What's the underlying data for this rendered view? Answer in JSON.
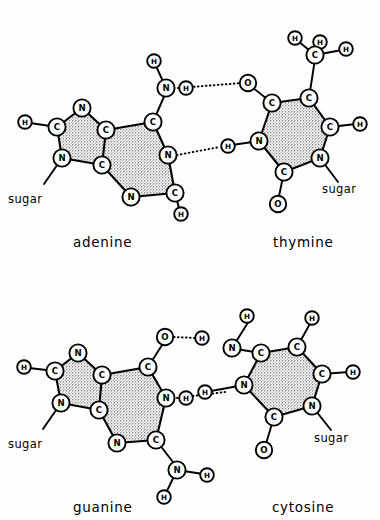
{
  "figure": {
    "style": {
      "line_color": "#000000",
      "background": "#ffffff",
      "ring_fill": "stippled gray",
      "ring_fill_hex": "#b9b9b9"
    }
  },
  "pairs": [
    {
      "id": "at",
      "left_label": "adenine",
      "right_label": "thymine",
      "left_sugar_label": "sugar",
      "right_sugar_label": "sugar",
      "hydrogen_bonds": 2,
      "hbond_descriptions": [
        "N-H···O",
        "N···H-N"
      ]
    },
    {
      "id": "gc",
      "left_label": "guanine",
      "right_label": "cytosine",
      "left_sugar_label": "sugar",
      "right_sugar_label": "sugar",
      "hydrogen_bonds": 2,
      "hbond_descriptions": [
        "O···H-N",
        "N-H···N"
      ]
    }
  ],
  "atoms": {
    "adenine": [
      {
        "e": "N",
        "x": 82,
        "y": 108
      },
      {
        "e": "C",
        "x": 57,
        "y": 127
      },
      {
        "e": "H",
        "x": 26,
        "y": 122
      },
      {
        "e": "N",
        "x": 62,
        "y": 158
      },
      {
        "e": "C",
        "x": 106,
        "y": 130
      },
      {
        "e": "C",
        "x": 102,
        "y": 165
      },
      {
        "e": "C",
        "x": 153,
        "y": 122
      },
      {
        "e": "N",
        "x": 168,
        "y": 155
      },
      {
        "e": "C",
        "x": 175,
        "y": 193
      },
      {
        "e": "N",
        "x": 131,
        "y": 197
      },
      {
        "e": "H",
        "x": 180,
        "y": 214
      },
      {
        "e": "N",
        "x": 166,
        "y": 88
      },
      {
        "e": "H",
        "x": 154,
        "y": 62
      }
    ],
    "thymine": [
      {
        "e": "O",
        "x": 248,
        "y": 83
      },
      {
        "e": "C",
        "x": 272,
        "y": 103
      },
      {
        "e": "C",
        "x": 309,
        "y": 98
      },
      {
        "e": "C",
        "x": 330,
        "y": 127
      },
      {
        "e": "H",
        "x": 360,
        "y": 124
      },
      {
        "e": "N",
        "x": 320,
        "y": 158
      },
      {
        "e": "C",
        "x": 284,
        "y": 172
      },
      {
        "e": "O",
        "x": 277,
        "y": 204
      },
      {
        "e": "N",
        "x": 259,
        "y": 141
      },
      {
        "e": "C",
        "x": 315,
        "y": 55
      },
      {
        "e": "H",
        "x": 295,
        "y": 38
      },
      {
        "e": "H",
        "x": 320,
        "y": 40
      },
      {
        "e": "H",
        "x": 346,
        "y": 49
      },
      {
        "e": "H",
        "x": 228,
        "y": 146
      }
    ],
    "guanine": [
      {
        "e": "N",
        "x": 78,
        "y": 353
      },
      {
        "e": "C",
        "x": 55,
        "y": 371
      },
      {
        "e": "H",
        "x": 25,
        "y": 367
      },
      {
        "e": "N",
        "x": 61,
        "y": 403
      },
      {
        "e": "C",
        "x": 102,
        "y": 375
      },
      {
        "e": "C",
        "x": 99,
        "y": 410
      },
      {
        "e": "C",
        "x": 148,
        "y": 367
      },
      {
        "e": "N",
        "x": 166,
        "y": 398
      },
      {
        "e": "C",
        "x": 156,
        "y": 440
      },
      {
        "e": "N",
        "x": 117,
        "y": 443
      },
      {
        "e": "O",
        "x": 165,
        "y": 337
      },
      {
        "e": "N",
        "x": 177,
        "y": 470
      },
      {
        "e": "H",
        "x": 207,
        "y": 475
      },
      {
        "e": "H",
        "x": 164,
        "y": 497
      }
    ],
    "cytosine": [
      {
        "e": "N",
        "x": 244,
        "y": 385
      },
      {
        "e": "H",
        "x": 205,
        "y": 392
      },
      {
        "e": "C",
        "x": 261,
        "y": 353
      },
      {
        "e": "C",
        "x": 297,
        "y": 347
      },
      {
        "e": "H",
        "x": 312,
        "y": 318
      },
      {
        "e": "C",
        "x": 322,
        "y": 374
      },
      {
        "e": "H",
        "x": 353,
        "y": 372
      },
      {
        "e": "N",
        "x": 312,
        "y": 406
      },
      {
        "e": "C",
        "x": 274,
        "y": 417
      },
      {
        "e": "O",
        "x": 264,
        "y": 450
      },
      {
        "e": "N",
        "x": 232,
        "y": 348
      },
      {
        "e": "H",
        "x": 251,
        "y": 317
      },
      {
        "e": "H",
        "x": 247,
        "y": 292
      }
    ]
  }
}
